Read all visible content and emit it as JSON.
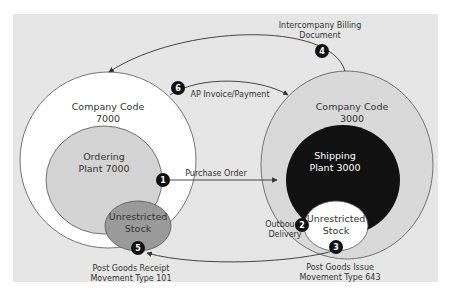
{
  "diagram": {
    "nodes": {
      "company_code_7000": {
        "line1": "Company Code",
        "line2": "7000"
      },
      "ordering_plant": {
        "line1": "Ordering",
        "line2": "Plant 7000"
      },
      "stock_left": {
        "line1": "Unrestricted",
        "line2": "Stock"
      },
      "company_code_3000": {
        "line1": "Company Code",
        "line2": "3000"
      },
      "shipping_plant": {
        "line1": "Shipping",
        "line2": "Plant 3000"
      },
      "stock_right": {
        "line1": "Unrestricted",
        "line2": "Stock"
      }
    },
    "steps": [
      {
        "num": "1",
        "label1": "Purchase Order",
        "label2": ""
      },
      {
        "num": "2",
        "label1": "Outbound",
        "label2": "Delivery"
      },
      {
        "num": "3",
        "label1": "Post Goods Issue",
        "label2": "Movement Type 643"
      },
      {
        "num": "4",
        "label1": "Intercompany Billing",
        "label2": "Document"
      },
      {
        "num": "5",
        "label1": "Post Goods Receipt",
        "label2": "Movement Type 101"
      },
      {
        "num": "6",
        "label1": "AP Invoice/Payment",
        "label2": ""
      }
    ],
    "colors": {
      "background": "#e6e6e6",
      "company_code": "#ffffff",
      "company_code_right": "#d9d9d9",
      "ordering_plant": "#d4d4d4",
      "stock_left": "#9a9a9a",
      "shipping_plant": "#111111",
      "stock_right": "#ffffff",
      "badge": "#111111"
    }
  }
}
